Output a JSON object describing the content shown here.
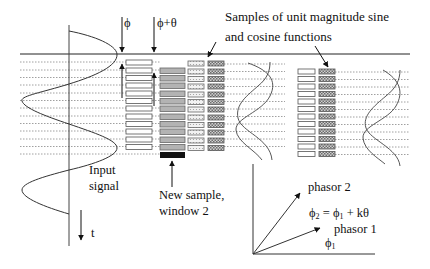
{
  "title_annotation": {
    "line1": "Samples of unit magnitude sine",
    "line2": "and cosine functions"
  },
  "phase_markers": {
    "phi": "ϕ",
    "phi_plus_theta": "ϕ+θ"
  },
  "input_signal": {
    "line1": "Input",
    "line2": "signal"
  },
  "time_axis_label": "t",
  "new_sample": {
    "line1": "New sample,",
    "line2": "window 2"
  },
  "phasor_diagram": {
    "phasor2_label": "phasor 2",
    "phasor1_label": "phasor 1",
    "equation": {
      "phi": "ϕ",
      "sub2": "2",
      "eq": " = ",
      "phi_b": "ϕ",
      "sub1": "1",
      "rest": " + kθ"
    },
    "angle_label": {
      "phi": "ϕ",
      "sub": "1"
    }
  },
  "layout": {
    "sample_rows": 12,
    "colors": {
      "line": "#222222",
      "dotted": "#888888",
      "block_white": "#ffffff",
      "block_gray": "#b3b3b3",
      "block_new": "#111111",
      "block_light": "#e8e8e8",
      "block_checker": "#9a9a9a"
    }
  }
}
